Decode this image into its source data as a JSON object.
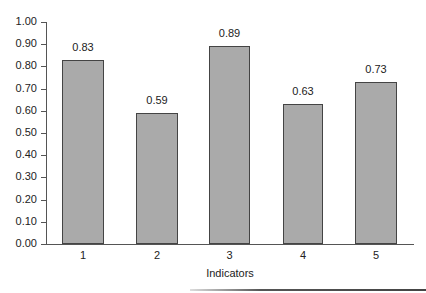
{
  "chart_data": {
    "type": "bar",
    "title": "",
    "xlabel": "Indicators",
    "ylabel": "",
    "categories": [
      "1",
      "2",
      "3",
      "4",
      "5"
    ],
    "values": [
      0.83,
      0.59,
      0.89,
      0.63,
      0.73
    ],
    "value_labels": [
      "0.83",
      "0.59",
      "0.89",
      "0.63",
      "0.73"
    ],
    "ylim": [
      0,
      1.0
    ],
    "yticks": [
      "0.00",
      "0.10",
      "0.20",
      "0.30",
      "0.40",
      "0.50",
      "0.60",
      "0.70",
      "0.80",
      "0.90",
      "1.00"
    ],
    "grid": false,
    "legend": null,
    "bar_color": "#aaaaaa",
    "bar_edge_color": "#444444"
  }
}
